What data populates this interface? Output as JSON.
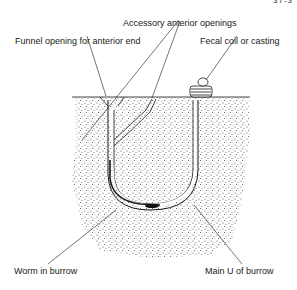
{
  "diagram": {
    "title": "",
    "corner_text": "37-3",
    "labels": {
      "accessory_openings": "Accessory anterior openings",
      "funnel_opening": "Funnel opening for anterior end",
      "fecal_coil": "Fecal coil or casting",
      "worm_in_burrow": "Worm in burrow",
      "main_u": "Main U of burrow"
    },
    "colors": {
      "ink": "#1a1a1a",
      "sediment": "#d9d9d9",
      "background": "#ffffff"
    }
  }
}
